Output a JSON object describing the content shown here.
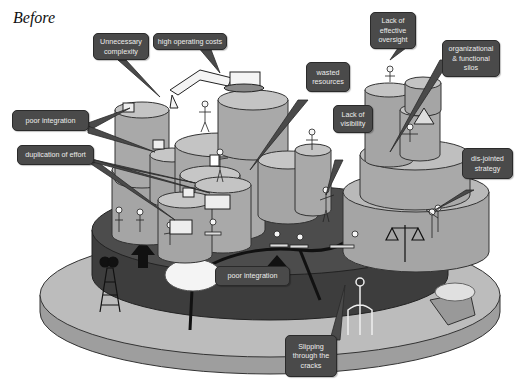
{
  "title": "Before",
  "colors": {
    "bubble_fill": "#4a4a4a",
    "bubble_text": "#ececec",
    "dark_platform": "#3a3a3a",
    "base_platform": "#b8b8b8",
    "cylinder": "#a9a9a9",
    "cylinder_top": "#c4c4c4"
  },
  "callouts": [
    {
      "id": "unnecessary-complexity",
      "text": "Unnecessary complexity"
    },
    {
      "id": "high-operating-costs",
      "text": "high operating costs"
    },
    {
      "id": "lack-of-effective-oversight",
      "text": "Lack of effective oversight"
    },
    {
      "id": "organizational-functional-silos",
      "text": "organizational & functional silos"
    },
    {
      "id": "wasted-resources",
      "text": "wasted resources"
    },
    {
      "id": "poor-integration-top",
      "text": "poor integration"
    },
    {
      "id": "lack-of-visibility",
      "text": "Lack of visibility"
    },
    {
      "id": "duplication-of-effort",
      "text": "duplication of effort"
    },
    {
      "id": "dis-jointed-strategy",
      "text": "dis-jointed strategy"
    },
    {
      "id": "poor-integration-bottom",
      "text": "poor integration"
    },
    {
      "id": "slipping-through-the-cracks",
      "text": "Slipping through the cracks"
    }
  ],
  "speech": {
    "cost_curse": "$$%^*!",
    "silo_curse": "#@%&!"
  }
}
